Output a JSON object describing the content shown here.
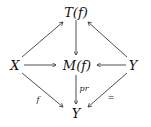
{
  "diagram": {
    "nodes": {
      "top": "T(f)",
      "left": "X",
      "center": "M(f)",
      "right": "Y",
      "bottom": "Y"
    },
    "edges": [
      {
        "from": "left",
        "to": "top",
        "label": ""
      },
      {
        "from": "right",
        "to": "top",
        "label": ""
      },
      {
        "from": "top",
        "to": "center",
        "label": ""
      },
      {
        "from": "left",
        "to": "center",
        "label": ""
      },
      {
        "from": "right",
        "to": "center",
        "label": ""
      },
      {
        "from": "left",
        "to": "bottom",
        "label": "f"
      },
      {
        "from": "center",
        "to": "bottom",
        "label": "pr"
      },
      {
        "from": "right",
        "to": "bottom",
        "label": "="
      }
    ],
    "labels": {
      "f": "f",
      "pr": "pr",
      "eq": "="
    }
  }
}
